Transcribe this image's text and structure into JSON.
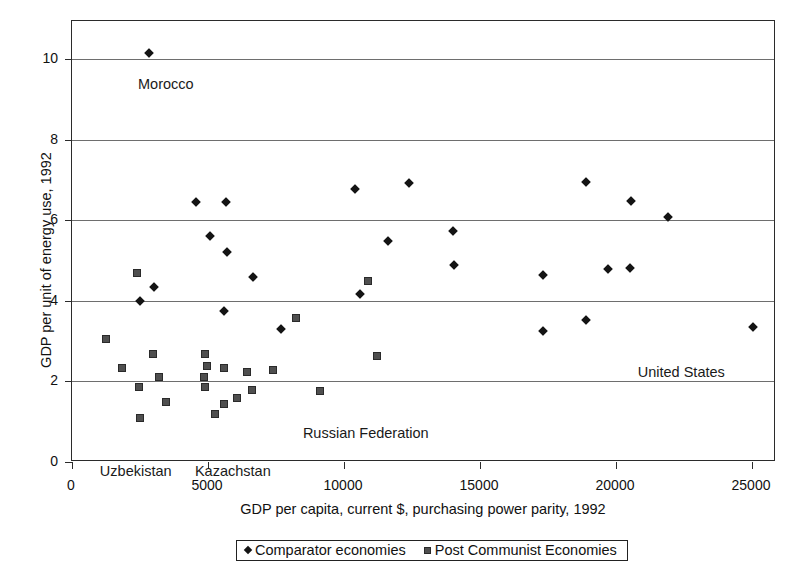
{
  "chart_data": {
    "type": "scatter",
    "title": "",
    "xlabel": "GDP per capita, current $, purchasing power parity, 1992",
    "ylabel": "GDP per unit of energy use, 1992",
    "xlim": [
      0,
      25882
    ],
    "ylim": [
      0,
      10.94
    ],
    "xticks": [
      0,
      5000,
      10000,
      15000,
      20000,
      25000
    ],
    "xtick_labels": [
      "0",
      "5000",
      "10000",
      "15000",
      "20000",
      "25000"
    ],
    "yticks": [
      0,
      2,
      4,
      6,
      8,
      10
    ],
    "ytick_labels": [
      "0",
      "2",
      "4",
      "6",
      "8",
      "10"
    ],
    "grid": "horizontal",
    "legend_position": "bottom-center",
    "series": [
      {
        "name": "Comparator economies",
        "marker": "diamond",
        "color": "#141414",
        "points": [
          [
            2830,
            10.15
          ],
          [
            2500,
            3.99
          ],
          [
            3000,
            4.33
          ],
          [
            4560,
            6.45
          ],
          [
            5650,
            6.45
          ],
          [
            5080,
            5.6
          ],
          [
            5690,
            5.21
          ],
          [
            5600,
            3.74
          ],
          [
            6640,
            4.59
          ],
          [
            7700,
            3.3
          ],
          [
            10400,
            6.77
          ],
          [
            10600,
            4.16
          ],
          [
            12400,
            6.92
          ],
          [
            11600,
            5.48
          ],
          [
            14000,
            5.74
          ],
          [
            14050,
            4.88
          ],
          [
            17300,
            3.24
          ],
          [
            17300,
            4.64
          ],
          [
            18900,
            6.94
          ],
          [
            18900,
            3.53
          ],
          [
            19700,
            4.78
          ],
          [
            20500,
            4.82
          ],
          [
            20550,
            6.48
          ],
          [
            21900,
            6.07
          ],
          [
            25050,
            3.34
          ]
        ]
      },
      {
        "name": "Post Communist Economies",
        "marker": "square",
        "color": "#4f4f4f",
        "points": [
          [
            1250,
            3.04
          ],
          [
            1850,
            2.32
          ],
          [
            2400,
            4.7
          ],
          [
            2450,
            1.86
          ],
          [
            2500,
            1.1
          ],
          [
            2980,
            2.69
          ],
          [
            3200,
            2.1
          ],
          [
            3450,
            1.5
          ],
          [
            4900,
            2.68
          ],
          [
            4950,
            2.37
          ],
          [
            4870,
            2.1
          ],
          [
            4880,
            1.86
          ],
          [
            5250,
            1.2
          ],
          [
            5600,
            2.33
          ],
          [
            5600,
            1.45
          ],
          [
            6050,
            1.6
          ],
          [
            6450,
            2.24
          ],
          [
            6600,
            1.78
          ],
          [
            7400,
            2.27
          ],
          [
            8250,
            3.58
          ],
          [
            9100,
            1.75
          ],
          [
            10900,
            4.5
          ],
          [
            11200,
            2.62
          ]
        ]
      }
    ],
    "annotations": [
      {
        "text": "Morocco",
        "x": 3450,
        "y": 9.35,
        "inside": true
      },
      {
        "text": "Russian Federation",
        "x": 10800,
        "y": 0.7,
        "inside": true
      },
      {
        "text": "United States",
        "x": 22400,
        "y": 2.22,
        "inside": true
      },
      {
        "text": "Uzbekistan",
        "x": 2380,
        "axis": "x"
      },
      {
        "text": "Kazachstan",
        "x": 5950,
        "axis": "x"
      }
    ]
  },
  "legend": {
    "items": [
      {
        "label": "Comparator economies",
        "marker": "diamond-marker-icon"
      },
      {
        "label": "Post Communist Economies",
        "marker": "square-marker-icon"
      }
    ]
  }
}
